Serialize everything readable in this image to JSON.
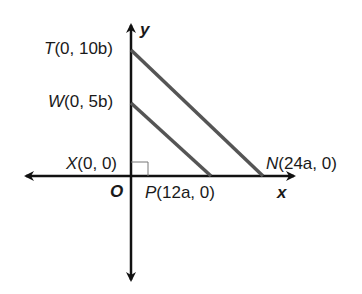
{
  "diagram": {
    "type": "coordinate-geometry",
    "axes": {
      "x_label": "x",
      "y_label": "y",
      "origin_label": "O"
    },
    "points": [
      {
        "name": "T",
        "coords": "(0, 10b)",
        "label": "T(0, 10b)"
      },
      {
        "name": "W",
        "coords": "(0, 5b)",
        "label": "W(0, 5b)"
      },
      {
        "name": "X",
        "coords": "(0, 0)",
        "label": "X(0, 0)"
      },
      {
        "name": "P",
        "coords": "(12a, 0)",
        "label": "P(12a, 0)"
      },
      {
        "name": "N",
        "coords": "(24a, 0)",
        "label": "N(24a, 0)"
      }
    ],
    "segments": [
      {
        "from": "T",
        "to": "N"
      },
      {
        "from": "W",
        "to": "P"
      }
    ],
    "right_angle_at": "X",
    "colors": {
      "axis": "#111111",
      "segment": "#555555",
      "text": "#1a1a1a"
    }
  }
}
